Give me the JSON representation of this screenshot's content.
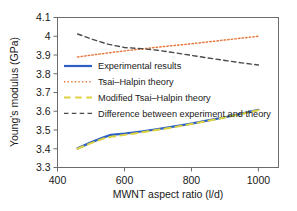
{
  "chart_data": {
    "type": "line",
    "title": "",
    "xlabel": "MWNT aspect ratio (l/d)",
    "ylabel": "Young's modulus (GPa)",
    "xlim": [
      400,
      1060
    ],
    "ylim": [
      3.3,
      4.1
    ],
    "xticks": [
      400,
      600,
      800,
      1000
    ],
    "xtick_labels": [
      "400",
      "600",
      "800",
      "1000"
    ],
    "yticks": [
      3.3,
      3.4,
      3.5,
      3.6,
      3.7,
      3.8,
      3.9,
      4.0,
      4.1
    ],
    "ytick_labels": [
      "3.3",
      "3.4",
      "3.5",
      "3.6",
      "3.7",
      "3.8",
      "3.9",
      "4",
      "4.1"
    ],
    "grid": false,
    "legend_position": "center-left",
    "series": [
      {
        "name": "Experimental results",
        "color": "#2b5fc4",
        "style": "solid",
        "width": 2.2,
        "x": [
          460,
          500,
          540,
          560,
          600,
          650,
          700,
          750,
          800,
          850,
          900,
          950,
          1000
        ],
        "y": [
          3.402,
          3.434,
          3.462,
          3.474,
          3.481,
          3.492,
          3.505,
          3.519,
          3.534,
          3.551,
          3.568,
          3.587,
          3.608
        ]
      },
      {
        "name": "Tsai–Halpin theory",
        "color": "#e8763a",
        "style": "dotted",
        "width": 1.5,
        "x": [
          460,
          500,
          550,
          600,
          650,
          700,
          750,
          800,
          850,
          900,
          950,
          1000
        ],
        "y": [
          3.889,
          3.899,
          3.911,
          3.922,
          3.932,
          3.942,
          3.951,
          3.96,
          3.97,
          3.98,
          3.99,
          4.0
        ]
      },
      {
        "name": "Modified Tsai–Halpin theory",
        "color": "#ddd23f",
        "style": "dashed",
        "width": 2.0,
        "x": [
          460,
          500,
          540,
          560,
          600,
          650,
          700,
          750,
          800,
          850,
          900,
          950,
          1000
        ],
        "y": [
          3.4,
          3.43,
          3.456,
          3.464,
          3.474,
          3.487,
          3.501,
          3.516,
          3.532,
          3.549,
          3.567,
          3.586,
          3.606
        ]
      },
      {
        "name": "Difference between experiment and theory",
        "color": "#4a4a4a",
        "style": "dashed",
        "width": 1.4,
        "x": [
          460,
          500,
          550,
          600,
          650,
          700,
          750,
          800,
          850,
          900,
          950,
          1000
        ],
        "y": [
          4.012,
          3.986,
          3.958,
          3.94,
          3.934,
          3.925,
          3.912,
          3.898,
          3.884,
          3.871,
          3.858,
          3.847
        ]
      }
    ]
  },
  "legend": {
    "items": [
      {
        "label": "Experimental results",
        "color": "#2b5fc4",
        "style": "solid"
      },
      {
        "label": "Tsai–Halpin theory",
        "color": "#e8763a",
        "style": "dotted"
      },
      {
        "label": "Modified Tsai–Halpin theory",
        "color": "#ddd23f",
        "style": "dashed"
      },
      {
        "label": "Difference between experiment and theory",
        "color": "#4a4a4a",
        "style": "dashed"
      }
    ]
  },
  "axes": {
    "frame_color": "#6b6b6b",
    "background": "#ffffff"
  }
}
